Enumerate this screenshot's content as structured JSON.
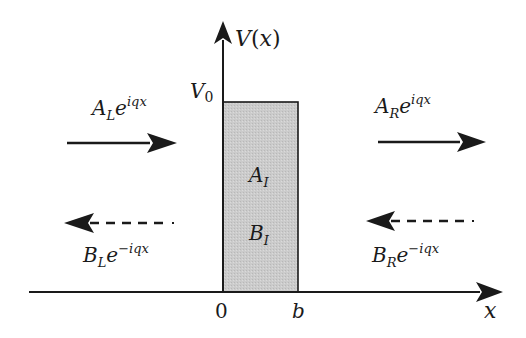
{
  "diagram": {
    "type": "rectangular potential barrier",
    "y_axis_label": "V(x)",
    "x_axis_label": "x",
    "barrier_height_label": "V_0",
    "tick_labels": {
      "left_edge": "0",
      "right_edge": "b"
    },
    "barrier_fill_color": "#c8c8c8",
    "line_color": "#1a1a1a",
    "regions": {
      "left": {
        "incoming": {
          "coef": "A",
          "sub": "L",
          "exp": "iqx",
          "direction": "right",
          "style": "solid"
        },
        "reflected": {
          "coef": "B",
          "sub": "L",
          "exp": "−iqx",
          "direction": "left",
          "style": "dashed"
        }
      },
      "inside": {
        "coef_a": {
          "coef": "A",
          "sub": "I"
        },
        "coef_b": {
          "coef": "B",
          "sub": "I"
        }
      },
      "right": {
        "transmitted": {
          "coef": "A",
          "sub": "R",
          "exp": "iqx",
          "direction": "right",
          "style": "solid"
        },
        "incoming": {
          "coef": "B",
          "sub": "R",
          "exp": "−iqx",
          "direction": "left",
          "style": "dashed"
        }
      }
    }
  }
}
